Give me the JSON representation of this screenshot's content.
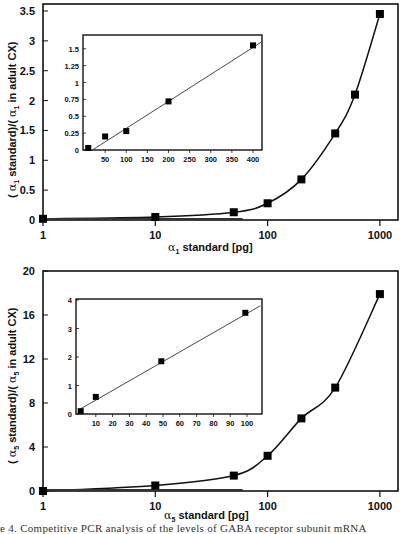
{
  "chart_data": [
    {
      "type": "scatter",
      "title": "",
      "xlabel": "α1 standard [pg]",
      "ylabel": "(α1 standard)/(α1 in adult CX)",
      "xscale": "log",
      "xlim": [
        1,
        1000
      ],
      "ylim": [
        0,
        3.5
      ],
      "x_ticks": [
        "1",
        "10",
        "100",
        "1000"
      ],
      "y_ticks": [
        "0",
        "0.5",
        "1",
        "1.5",
        "2",
        "2.5",
        "3",
        "3.5"
      ],
      "grid": false,
      "series": [
        {
          "name": "α1 data",
          "x": [
            1,
            10,
            50,
            100,
            200,
            400,
            600,
            1000
          ],
          "y": [
            0.02,
            0.05,
            0.13,
            0.28,
            0.68,
            1.45,
            2.1,
            3.45
          ],
          "marker": "square"
        },
        {
          "name": "fit curve",
          "type": "line"
        }
      ],
      "inset": {
        "type": "scatter",
        "xlim": [
          0,
          420
        ],
        "ylim": [
          0,
          1.6
        ],
        "x_ticks": [
          "50",
          "100",
          "150",
          "200",
          "250",
          "300",
          "350",
          "400"
        ],
        "y_ticks": [
          "0",
          "0.25",
          "0.5",
          "0.75",
          "1",
          "1.25",
          "1.5"
        ],
        "x": [
          10,
          50,
          100,
          200,
          400
        ],
        "y": [
          0.03,
          0.2,
          0.28,
          0.72,
          1.55
        ],
        "fit_line": [
          [
            20,
            0.0
          ],
          [
            420,
            1.6
          ]
        ]
      }
    },
    {
      "type": "scatter",
      "title": "",
      "xlabel": "α5 standard [pg]",
      "ylabel": "(α5 standard)/(α5 in adult CX)",
      "xscale": "log",
      "xlim": [
        1,
        1000
      ],
      "ylim": [
        0,
        20
      ],
      "x_ticks": [
        "1",
        "10",
        "100",
        "1000"
      ],
      "y_ticks": [
        "0",
        "4",
        "8",
        "12",
        "16",
        "20"
      ],
      "grid": false,
      "series": [
        {
          "name": "α5 data",
          "x": [
            1,
            10,
            50,
            100,
            200,
            400,
            1000
          ],
          "y": [
            0.0,
            0.5,
            1.4,
            3.2,
            6.6,
            9.4,
            17.9
          ],
          "marker": "square"
        },
        {
          "name": "fit curve",
          "type": "line"
        }
      ],
      "inset": {
        "type": "scatter",
        "xlim": [
          0,
          108
        ],
        "ylim": [
          0,
          4
        ],
        "x_ticks": [
          "10",
          "20",
          "30",
          "40",
          "50",
          "60",
          "70",
          "80",
          "90",
          "100"
        ],
        "y_ticks": [
          "0",
          "1",
          "2",
          "3",
          "4"
        ],
        "x": [
          1,
          10,
          49,
          99
        ],
        "y": [
          0.1,
          0.6,
          1.85,
          3.55
        ],
        "fit_line": [
          [
            0,
            0.15
          ],
          [
            108,
            3.8
          ]
        ]
      }
    }
  ],
  "labels": {
    "top": {
      "x_alpha": "α",
      "x_sub": "1",
      "x_text": " standard   [pg]",
      "y_open": "( ",
      "y_alpha": "α",
      "y_sub": "1",
      "y_mid": " standard)/( ",
      "y_sub2": "1",
      "y_end": " in  adult  CX)"
    },
    "bottom": {
      "x_alpha": "α",
      "x_sub": "5",
      "x_text": " standard   [pg]",
      "y_open": "( ",
      "y_alpha": "α",
      "y_sub": "5",
      "y_mid": " standard)/( ",
      "y_sub2": "5",
      "y_end": " in  adult  CX)"
    }
  },
  "caption": "e 4.   Competitive  PCR  analysis  of  the  levels  of  GABA  receptor  subunit  mRNA"
}
